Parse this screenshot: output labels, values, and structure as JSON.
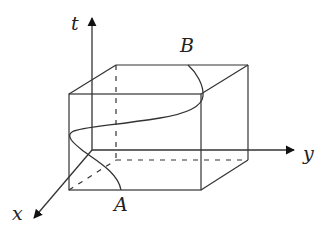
{
  "diagram": {
    "type": "3d-box-with-axes",
    "axes": {
      "t": {
        "label": "t",
        "direction": "up"
      },
      "y": {
        "label": "y",
        "direction": "right"
      },
      "x": {
        "label": "x",
        "direction": "down-left"
      }
    },
    "points": {
      "A": {
        "label": "A",
        "position": "bottom front edge"
      },
      "B": {
        "label": "B",
        "position": "top back edge"
      }
    },
    "curve": {
      "from": "A",
      "to": "B",
      "description": "S-shaped curve through box"
    },
    "colors": {
      "line": "#333333",
      "background": "#ffffff"
    }
  }
}
